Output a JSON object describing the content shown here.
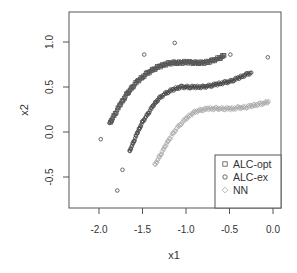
{
  "chart_data": {
    "type": "scatter",
    "title": "",
    "xlabel": "x1",
    "ylabel": "x2",
    "xlim": [
      -2.35,
      0.09
    ],
    "ylim": [
      -0.85,
      1.33
    ],
    "xticks": [
      -2.0,
      -1.5,
      -1.0,
      -0.5,
      0.0
    ],
    "xtick_labels": [
      "-2.0",
      "-1.5",
      "-1.0",
      "-0.5",
      "0.0"
    ],
    "yticks": [
      -0.5,
      0.0,
      0.5,
      1.0
    ],
    "ytick_labels": [
      "-0.5",
      "0.0",
      "0.5",
      "1.0"
    ],
    "grid": false,
    "legend_position": "bottom-right",
    "series": [
      {
        "name": "ALC-opt",
        "marker": "square",
        "color": "#555555",
        "points": [
          [
            -1.87,
            0.1
          ],
          [
            -1.84,
            0.16
          ],
          [
            -1.8,
            0.23
          ],
          [
            -1.76,
            0.3
          ],
          [
            -1.72,
            0.36
          ],
          [
            -1.68,
            0.42
          ],
          [
            -1.64,
            0.47
          ],
          [
            -1.6,
            0.52
          ],
          [
            -1.55,
            0.57
          ],
          [
            -1.5,
            0.61
          ],
          [
            -1.45,
            0.65
          ],
          [
            -1.4,
            0.68
          ],
          [
            -1.35,
            0.71
          ],
          [
            -1.3,
            0.73
          ],
          [
            -1.25,
            0.75
          ],
          [
            -1.2,
            0.76
          ],
          [
            -1.15,
            0.77
          ],
          [
            -1.1,
            0.77
          ],
          [
            -1.05,
            0.77
          ],
          [
            -1.0,
            0.78
          ],
          [
            -0.95,
            0.77
          ],
          [
            -0.9,
            0.77
          ],
          [
            -0.85,
            0.77
          ],
          [
            -0.8,
            0.77
          ],
          [
            -0.75,
            0.78
          ],
          [
            -0.7,
            0.79
          ],
          [
            -0.65,
            0.81
          ],
          [
            -0.6,
            0.83
          ],
          [
            -0.56,
            0.85
          ]
        ]
      },
      {
        "name": "ALC-ex",
        "marker": "circle",
        "color": "#444444",
        "points": [
          [
            -1.65,
            -0.22
          ],
          [
            -1.62,
            -0.15
          ],
          [
            -1.59,
            -0.08
          ],
          [
            -1.56,
            -0.01
          ],
          [
            -1.53,
            0.05
          ],
          [
            -1.5,
            0.11
          ],
          [
            -1.46,
            0.17
          ],
          [
            -1.42,
            0.23
          ],
          [
            -1.38,
            0.29
          ],
          [
            -1.34,
            0.34
          ],
          [
            -1.3,
            0.38
          ],
          [
            -1.25,
            0.42
          ],
          [
            -1.2,
            0.45
          ],
          [
            -1.15,
            0.47
          ],
          [
            -1.1,
            0.49
          ],
          [
            -1.05,
            0.5
          ],
          [
            -1.0,
            0.5
          ],
          [
            -0.95,
            0.5
          ],
          [
            -0.9,
            0.5
          ],
          [
            -0.85,
            0.5
          ],
          [
            -0.8,
            0.5
          ],
          [
            -0.75,
            0.51
          ],
          [
            -0.7,
            0.52
          ],
          [
            -0.65,
            0.53
          ],
          [
            -0.6,
            0.54
          ],
          [
            -0.55,
            0.55
          ],
          [
            -0.5,
            0.56
          ],
          [
            -0.45,
            0.58
          ],
          [
            -0.4,
            0.6
          ],
          [
            -0.35,
            0.62
          ],
          [
            -0.3,
            0.64
          ],
          [
            -0.25,
            0.66
          ]
        ],
        "outliers": [
          [
            -1.98,
            -0.08
          ],
          [
            -1.73,
            -0.42
          ],
          [
            -1.79,
            -0.65
          ],
          [
            -1.88,
            0.1
          ],
          [
            -1.48,
            0.86
          ],
          [
            -1.13,
            0.99
          ],
          [
            -0.49,
            0.86
          ],
          [
            -0.06,
            0.83
          ]
        ]
      },
      {
        "name": "NN",
        "marker": "diamond",
        "color": "#aaaaaa",
        "points": [
          [
            -1.36,
            -0.37
          ],
          [
            -1.32,
            -0.3
          ],
          [
            -1.28,
            -0.23
          ],
          [
            -1.24,
            -0.16
          ],
          [
            -1.2,
            -0.09
          ],
          [
            -1.15,
            -0.02
          ],
          [
            -1.1,
            0.05
          ],
          [
            -1.05,
            0.1
          ],
          [
            -1.0,
            0.15
          ],
          [
            -0.95,
            0.19
          ],
          [
            -0.9,
            0.22
          ],
          [
            -0.85,
            0.24
          ],
          [
            -0.8,
            0.25
          ],
          [
            -0.75,
            0.26
          ],
          [
            -0.7,
            0.26
          ],
          [
            -0.65,
            0.26
          ],
          [
            -0.6,
            0.26
          ],
          [
            -0.55,
            0.26
          ],
          [
            -0.5,
            0.26
          ],
          [
            -0.45,
            0.26
          ],
          [
            -0.4,
            0.27
          ],
          [
            -0.35,
            0.27
          ],
          [
            -0.3,
            0.28
          ],
          [
            -0.25,
            0.29
          ],
          [
            -0.2,
            0.3
          ],
          [
            -0.15,
            0.31
          ],
          [
            -0.1,
            0.32
          ],
          [
            -0.05,
            0.34
          ]
        ]
      }
    ]
  },
  "legend": {
    "items": [
      {
        "label": "ALC-opt",
        "marker": "square",
        "color": "#555555"
      },
      {
        "label": "ALC-ex",
        "marker": "circle",
        "color": "#444444"
      },
      {
        "label": "NN",
        "marker": "diamond",
        "color": "#aaaaaa"
      }
    ]
  },
  "axes": {
    "xlabel": "x1",
    "ylabel": "x2"
  }
}
